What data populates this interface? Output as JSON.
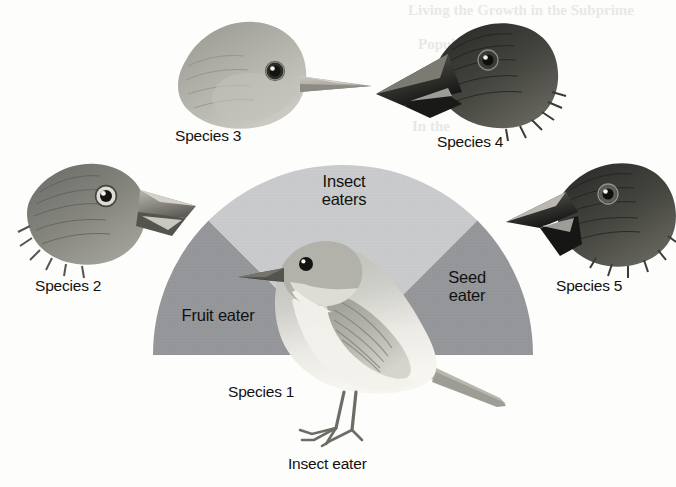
{
  "figure": {
    "type": "diagram",
    "background_color": "#fdfdfc",
    "fan": {
      "center_x": 343,
      "center_y": 355,
      "radius": 190,
      "light_wedge_color": "#c8cacb",
      "dark_wedge_color": "#949699",
      "wedges": [
        {
          "name": "fruit-eater",
          "label": "Fruit eater",
          "start_deg": 180,
          "end_deg": 135,
          "shade": "dark"
        },
        {
          "name": "insect-eaters",
          "label": "Insect\neaters",
          "start_deg": 135,
          "end_deg": 45,
          "shade": "light"
        },
        {
          "name": "seed-eater",
          "label": "Seed\neater",
          "start_deg": 45,
          "end_deg": 0,
          "shade": "dark"
        }
      ]
    }
  },
  "wedge_labels": {
    "insect_eaters": "Insect\neaters",
    "fruit_eater": "Fruit eater",
    "seed_eater": "Seed\neater"
  },
  "species": [
    {
      "id": 1,
      "label": "Species 1",
      "diet": "Insect eater",
      "position": "center-bottom",
      "illustration": "whole-bird-warbler-finch",
      "beak": "thin-pointed",
      "tone": "light"
    },
    {
      "id": 2,
      "label": "Species 2",
      "diet": "",
      "position": "left",
      "illustration": "bird-head-large-blunt-beak-facing-right",
      "beak": "large-blunt",
      "tone": "mid-dark"
    },
    {
      "id": 3,
      "label": "Species 3",
      "diet": "",
      "position": "top-left",
      "illustration": "bird-head-slender-beak-facing-right",
      "beak": "slender-pointed",
      "tone": "light"
    },
    {
      "id": 4,
      "label": "Species 4",
      "diet": "",
      "position": "top-right",
      "illustration": "bird-head-long-heavy-beak-facing-left",
      "beak": "long-heavy",
      "tone": "dark"
    },
    {
      "id": 5,
      "label": "Species 5",
      "diet": "",
      "position": "right",
      "illustration": "bird-head-deep-crushing-beak-facing-left",
      "beak": "deep-crushing",
      "tone": "dark"
    }
  ],
  "captions": {
    "species1": "Species 1",
    "species2": "Species 2",
    "species3": "Species 3",
    "species4": "Species 4",
    "species5": "Species 5",
    "species1_diet": "Insect eater"
  },
  "bleed_through": {
    "line1": "Living the Growth in the Subprime",
    "line2": "Population",
    "line3": "In the"
  }
}
